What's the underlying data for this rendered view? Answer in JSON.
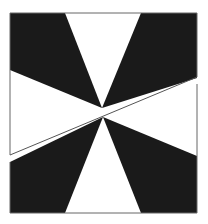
{
  "figure": {
    "colors": {
      "background": "#ffffff",
      "fill_dark": "#1a1a1a",
      "fill_light": "#ffffff",
      "line": "#555555"
    }
  }
}
